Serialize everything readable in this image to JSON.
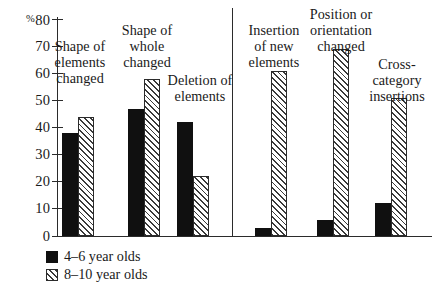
{
  "chart_data": {
    "type": "bar",
    "title": "",
    "subtitle": "",
    "xlabel": "",
    "ylabel": "%",
    "ylim": [
      0,
      80
    ],
    "ytick_values": [
      0,
      10,
      20,
      30,
      40,
      50,
      60,
      70,
      80
    ],
    "ytick_labels": [
      "0",
      "10",
      "20",
      "30",
      "40",
      "50",
      "60",
      "70",
      "80"
    ],
    "y_axis_unit_prefix": "%",
    "grid": false,
    "legend_position": "bottom-left",
    "panel_divider_after_category": 3,
    "categories": [
      "Shape of\nelements\nchanged",
      "Shape of\nwhole\nchanged",
      "Deletion of\nelements",
      "Insertion\nof new\nelements",
      "Position or\norientation\nchanged",
      "Cross-\ncategory\ninsertions"
    ],
    "series": [
      {
        "name": "4–6 year olds",
        "pattern": "solid",
        "values": [
          38,
          47,
          42,
          3,
          6,
          12
        ]
      },
      {
        "name": "8–10 year olds",
        "pattern": "hatched",
        "values": [
          44,
          58,
          22,
          61,
          69,
          51
        ]
      }
    ]
  },
  "legend": {
    "items": [
      {
        "label": "4–6 year olds",
        "pattern": "solid"
      },
      {
        "label": "8–10 year olds",
        "pattern": "hatched"
      }
    ]
  },
  "category_labels": [
    {
      "text": "Shape of\nelements\nchanged"
    },
    {
      "text": "Shape of\nwhole\nchanged"
    },
    {
      "text": "Deletion of\nelements"
    },
    {
      "text": "Insertion\nof new\nelements"
    },
    {
      "text": "Position or\norientation\nchanged"
    },
    {
      "text": "Cross-\ncategory\ninsertions"
    }
  ],
  "axis": {
    "unit_prefix": "%",
    "ticks": [
      "80",
      "70",
      "60",
      "50",
      "40",
      "30",
      "20",
      "10",
      "0"
    ]
  }
}
